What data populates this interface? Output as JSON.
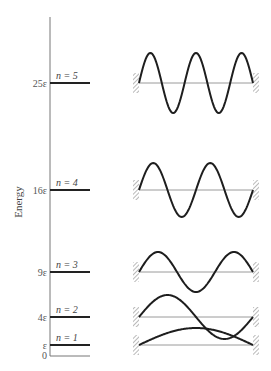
{
  "diagram": {
    "axis_title": "Energy",
    "axis": {
      "x": 50,
      "y_top": 17,
      "y_bottom": 356,
      "x_end": 90
    },
    "zero_label": "0",
    "walls": {
      "left_x": 139,
      "right_x": 253
    },
    "levels": [
      {
        "n": 1,
        "n_label": "n = 1",
        "energy_label": "ε",
        "y": 345,
        "amplitude": 17,
        "half_waves": 1
      },
      {
        "n": 2,
        "n_label": "n = 2",
        "energy_label": "4ε",
        "y": 317,
        "amplitude": 22,
        "half_waves": 2
      },
      {
        "n": 3,
        "n_label": "n = 3",
        "energy_label": "9ε",
        "y": 272,
        "amplitude": 20,
        "half_waves": 3
      },
      {
        "n": 4,
        "n_label": "n = 4",
        "energy_label": "16ε",
        "y": 190,
        "amplitude": 27,
        "half_waves": 4
      },
      {
        "n": 5,
        "n_label": "n = 5",
        "energy_label": "25ε",
        "y": 83,
        "amplitude": 30,
        "half_waves": 5
      }
    ],
    "colors": {
      "wave": "#1e1e1e",
      "level": "#222222",
      "axis": "#777777",
      "baseline": "#9a9a9a",
      "wall_hatch": "#8a8a8a"
    }
  }
}
